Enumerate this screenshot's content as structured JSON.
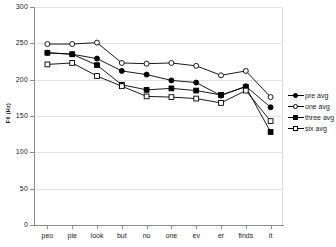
{
  "chart_data": {
    "type": "line",
    "title": "",
    "xlabel": "",
    "ylabel": "F0 (Hz)",
    "ylim": [
      0,
      300
    ],
    "yticks": [
      0,
      50,
      100,
      150,
      200,
      250,
      300
    ],
    "grid": true,
    "legend_position": "right",
    "categories": [
      "peo",
      "ple",
      "look",
      "but",
      "no",
      "one",
      "ev",
      "er",
      "finds",
      "it"
    ],
    "series": [
      {
        "name": "pre avg",
        "marker": "filled-circle",
        "values": [
          237,
          235,
          229,
          212,
          207,
          199,
          196,
          178,
          191,
          162
        ]
      },
      {
        "name": "one avg",
        "marker": "open-circle",
        "values": [
          249,
          249,
          251,
          223,
          222,
          223,
          219,
          206,
          212,
          176
        ]
      },
      {
        "name": "three avg",
        "marker": "filled-square",
        "values": [
          237,
          235,
          220,
          193,
          186,
          188,
          185,
          179,
          190,
          128
        ]
      },
      {
        "name": "six avg",
        "marker": "open-square",
        "values": [
          221,
          223,
          205,
          191,
          177,
          176,
          174,
          168,
          185,
          143
        ]
      }
    ]
  },
  "legend": {
    "items": [
      {
        "label": "pre avg",
        "marker": "filled-circle"
      },
      {
        "label": "one avg",
        "marker": "open-circle"
      },
      {
        "label": "three avg",
        "marker": "filled-square"
      },
      {
        "label": "six avg",
        "marker": "open-square"
      }
    ]
  },
  "colors": {
    "series": "#000000",
    "gridline": "#e2e2e2",
    "axis": "#8c8c8c",
    "text": "#1a1a1a",
    "background": "#ffffff"
  }
}
